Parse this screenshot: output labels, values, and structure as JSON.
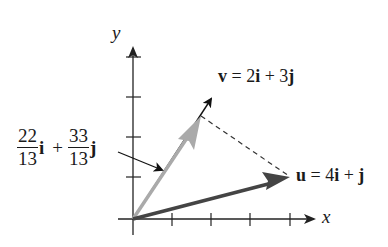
{
  "diagram": {
    "type": "vector-projection",
    "axes": {
      "x_label": "x",
      "y_label": "y",
      "x_ticks": [
        1,
        2,
        3,
        4
      ],
      "y_ticks": [
        1,
        2,
        3,
        4
      ]
    },
    "vectors": {
      "u": {
        "label_name": "u",
        "label_eq": "=",
        "label_expr_1": "4",
        "label_i": "i",
        "label_plus": "+",
        "label_j": "j",
        "components": [
          4,
          1
        ],
        "color": "#444444"
      },
      "v": {
        "label_name": "v",
        "label_eq": "=",
        "label_coef_i": "2",
        "label_i": "i",
        "label_plus": "+",
        "label_coef_j": "3",
        "label_j": "j",
        "components": [
          2,
          3
        ],
        "color": "#111111"
      },
      "projection": {
        "num_i": "22",
        "den_i": "13",
        "sym_i": "i",
        "plus": "+",
        "num_j": "33",
        "den_j": "13",
        "sym_j": "j",
        "components": [
          1.6923,
          2.5385
        ],
        "color": "#aaaaaa"
      }
    },
    "colors": {
      "axis": "#222222",
      "u_vector": "#444444",
      "projection_vector": "#aaaaaa",
      "dashed": "#333333",
      "text": "#1a1a1a"
    }
  }
}
